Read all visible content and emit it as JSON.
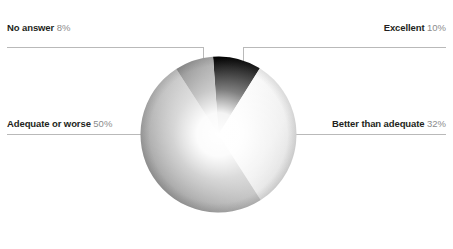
{
  "chart_data": {
    "type": "pie",
    "title": "",
    "subtitle": "",
    "xlabel": "",
    "ylabel": "",
    "legend_position": "callout-labels",
    "grid": false,
    "units": "percent",
    "total": 100,
    "categories": [
      "Excellent",
      "Better than adequate",
      "Adequate or worse",
      "No answer"
    ],
    "values": [
      10,
      32,
      50,
      8
    ],
    "slices": [
      {
        "label": "Excellent",
        "value": 10,
        "value_text": "10%",
        "color": "#1a1a1a",
        "gradient_from": "#000000",
        "gradient_to": "#4a4a4a",
        "start_angle": 6,
        "end_angle": 42,
        "callout": "top-right"
      },
      {
        "label": "Better than adequate",
        "value": 32,
        "value_text": "32%",
        "color": "#e8e8e8",
        "gradient_from": "#fbfbfb",
        "gradient_to": "#d6d6d6",
        "start_angle": 42,
        "end_angle": 157,
        "callout": "middle-right"
      },
      {
        "label": "Adequate or worse",
        "value": 50,
        "value_text": "50%",
        "color": "#b0b0b0",
        "gradient_from": "#cfcfcf",
        "gradient_to": "#949494",
        "start_angle": 157,
        "end_angle": 337,
        "callout": "middle-left"
      },
      {
        "label": "No answer",
        "value": 8,
        "value_text": "8%",
        "color": "#8a8a8a",
        "gradient_from": "#a6a6a6",
        "gradient_to": "#6e6e6e",
        "start_angle": 337,
        "end_angle": 6,
        "callout": "top-left"
      }
    ]
  },
  "labels": {
    "no_answer": {
      "name": "No answer",
      "pct": "8%"
    },
    "excellent": {
      "name": "Excellent",
      "pct": "10%"
    },
    "adequate_or_worse": {
      "name": "Adequate or worse",
      "pct": "50%"
    },
    "better_than_adequate": {
      "name": "Better than adequate",
      "pct": "32%"
    }
  },
  "style": {
    "background": "#ffffff",
    "leader_line_color": "#b9b9b9",
    "label_text_color": "#231f20",
    "percent_text_color": "#8c8c8c",
    "center_highlight": "#ffffff"
  }
}
